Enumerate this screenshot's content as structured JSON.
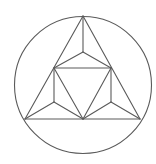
{
  "diagram": {
    "title": "",
    "stroke_color": "#5a5a5a",
    "stroke_width": 1.1,
    "circle": {
      "cx": 83,
      "cy": 85,
      "r": 68.5
    },
    "points": {
      "A": [
        83,
        16
      ],
      "B": [
        25,
        119
      ],
      "C": [
        140,
        119
      ],
      "O": [
        83,
        52
      ],
      "P": [
        54,
        68
      ],
      "Q": [
        111,
        68
      ],
      "R": [
        54,
        102
      ],
      "S": [
        111,
        102
      ],
      "M": [
        83,
        119
      ]
    },
    "segments": [
      [
        "A",
        "B"
      ],
      [
        "A",
        "C"
      ],
      [
        "B",
        "C"
      ],
      [
        "A",
        "O"
      ],
      [
        "O",
        "P"
      ],
      [
        "O",
        "Q"
      ],
      [
        "P",
        "Q"
      ],
      [
        "P",
        "R"
      ],
      [
        "Q",
        "S"
      ],
      [
        "R",
        "B"
      ],
      [
        "R",
        "M"
      ],
      [
        "S",
        "C"
      ],
      [
        "S",
        "M"
      ],
      [
        "P",
        "M"
      ],
      [
        "Q",
        "M"
      ]
    ]
  }
}
